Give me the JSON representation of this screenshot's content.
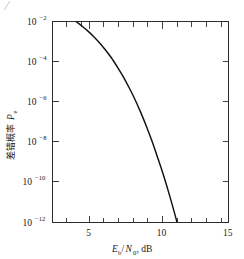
{
  "figure": {
    "corner_mark": "/",
    "background_color": "#ffffff",
    "line_color": "#111111",
    "axis_color": "#2b2b2b"
  },
  "chart_data": {
    "type": "line",
    "title": "",
    "subtitle": "",
    "xlabel": "Eb/N0, dB",
    "xlabel_parts": {
      "main1": "E",
      "sub1": "b",
      "slash": "/",
      "main2": "N",
      "sub2": "0",
      "tail": ", dB"
    },
    "ylabel": "差错概率 Pe",
    "ylabel_parts": {
      "cjk": "差错概率",
      "symbol": "P",
      "symbol_sub": "e"
    },
    "xlim": [
      3,
      15
    ],
    "ylim": [
      1e-12,
      0.01
    ],
    "yscale": "log",
    "xscale": "linear",
    "grid": false,
    "legend": null,
    "x_major_ticks": [
      5,
      10,
      15
    ],
    "x_major_tick_labels": [
      "5",
      "10",
      "15"
    ],
    "x_minor_tick_step": 1,
    "y_major_ticks": [
      -2,
      -4,
      -6,
      -8,
      -10,
      -12
    ],
    "y_major_tick_labels": [
      {
        "base": "10",
        "exp": "−2"
      },
      {
        "base": "10",
        "exp": "−4"
      },
      {
        "base": "10",
        "exp": "−6"
      },
      {
        "base": "10",
        "exp": "−8"
      },
      {
        "base": "10",
        "exp": "−10"
      },
      {
        "base": "10",
        "exp": "−12"
      }
    ],
    "series": [
      {
        "name": "Pe",
        "x": [
          4.6,
          5.0,
          5.4,
          5.8,
          6.2,
          6.6,
          7.0,
          7.4,
          7.8,
          8.2,
          8.6,
          9.0,
          9.4,
          9.8,
          10.2,
          10.6,
          11.0,
          11.4,
          11.8,
          12.2,
          12.6,
          13.0,
          13.4,
          13.8,
          14.0
        ],
        "y": [
          0.01,
          0.006,
          0.0034,
          0.0018,
          0.00088,
          0.00039,
          0.00016,
          5.7e-05,
          1.9e-05,
          5.4e-06,
          1.4e-06,
          3.1e-07,
          6e-08,
          1e-08,
          1.4e-09,
          1.8e-10,
          1.9e-11,
          1.7e-12,
          1.2e-13,
          7e-15,
          3.2e-16,
          1.2e-17,
          3.3e-19,
          7e-21,
          1e-21
        ]
      }
    ],
    "annotations": []
  }
}
